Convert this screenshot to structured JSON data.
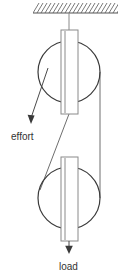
{
  "diagram": {
    "canvas": {
      "width": 139,
      "height": 277,
      "background": "#ffffff"
    },
    "colors": {
      "line": "#4a4a4a",
      "circle": "#3a3a3a",
      "block_stroke": "#8a8a8a",
      "rope": "#6e6e6e",
      "text": "#333333",
      "hatch": "#6a6a6a"
    },
    "labels": {
      "effort": "effort",
      "load": "load"
    },
    "ceiling": {
      "x_start": 33,
      "x_end": 118,
      "y": 13,
      "hatch_count": 22
    },
    "support_rod": {
      "x": 69,
      "y_top": 13,
      "y_bottom": 30
    },
    "top_pulley": {
      "cx": 69,
      "cy": 72,
      "r": 31
    },
    "bottom_pulley": {
      "cx": 69,
      "cy": 198,
      "r": 31
    },
    "top_block": {
      "x": 61,
      "y": 30,
      "width": 17,
      "height": 84
    },
    "bottom_block": {
      "x": 61,
      "y": 157,
      "width": 17,
      "height": 84
    },
    "load_rod": {
      "x": 69,
      "y_top": 241,
      "y_bottom": 252
    },
    "effort_arrow": {
      "from_x": 48,
      "from_y": 68,
      "to_x": 30,
      "to_y": 122,
      "label_x": 11,
      "label_y": 137
    },
    "load_arrow": {
      "from_x": 69,
      "from_y": 241,
      "to_x": 69,
      "to_y": 252,
      "label_x": 59,
      "label_y": 270
    },
    "ropes": [
      {
        "name": "right-vertical-rope",
        "x1": 100,
        "y1": 72,
        "x2": 100,
        "y2": 198
      },
      {
        "name": "diagonal-rope",
        "x1": 69,
        "y1": 114,
        "x2": 40,
        "y2": 190
      }
    ]
  }
}
